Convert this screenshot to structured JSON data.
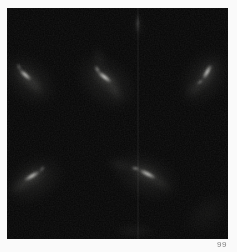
{
  "page": {
    "background": "#fafafa"
  },
  "figure": {
    "label": "99",
    "colors": {
      "background": "#060606",
      "core_rgb": "255,255,250",
      "glow_rgb": "190,190,182",
      "label_color": "#818181"
    },
    "noise_opacity": 0.09,
    "streaks": [
      {
        "name": "upper-left-arc",
        "parts": [
          {
            "type": "glow",
            "x": 22,
            "y": 72,
            "angle": 42,
            "len": 85,
            "w": 58,
            "op": 0.1
          },
          {
            "type": "glow",
            "x": 19,
            "y": 68,
            "angle": 42,
            "len": 44,
            "w": 17,
            "op": 0.2
          },
          {
            "type": "glow",
            "x": 29,
            "y": 78,
            "angle": 48,
            "len": 30,
            "w": 11,
            "op": 0.18
          },
          {
            "type": "core",
            "x": 18,
            "y": 67,
            "angle": 42,
            "len": 21,
            "w": 5.5,
            "op": 0.92
          },
          {
            "type": "core",
            "x": 12,
            "y": 59,
            "angle": 62,
            "len": 10,
            "w": 4,
            "op": 0.5
          }
        ]
      },
      {
        "name": "top-center-arc",
        "parts": [
          {
            "type": "glow",
            "x": 99,
            "y": 74,
            "angle": 40,
            "len": 92,
            "w": 64,
            "op": 0.11
          },
          {
            "type": "glow",
            "x": 98,
            "y": 70,
            "angle": 38,
            "len": 46,
            "w": 18,
            "op": 0.24
          },
          {
            "type": "glow",
            "x": 108,
            "y": 83,
            "angle": 55,
            "len": 30,
            "w": 11,
            "op": 0.2
          },
          {
            "type": "glow",
            "x": 92,
            "y": 50,
            "angle": 78,
            "len": 34,
            "w": 13,
            "op": 0.1
          },
          {
            "type": "core",
            "x": 97,
            "y": 69,
            "angle": 38,
            "len": 23,
            "w": 6,
            "op": 1.0
          },
          {
            "type": "core",
            "x": 90,
            "y": 61,
            "angle": 60,
            "len": 11,
            "w": 4.5,
            "op": 0.6
          }
        ]
      },
      {
        "name": "upper-right-arc",
        "parts": [
          {
            "type": "glow",
            "x": 197,
            "y": 70,
            "angle": -55,
            "len": 85,
            "w": 58,
            "op": 0.1
          },
          {
            "type": "glow",
            "x": 200,
            "y": 66,
            "angle": -60,
            "len": 44,
            "w": 17,
            "op": 0.22
          },
          {
            "type": "glow",
            "x": 188,
            "y": 80,
            "angle": -42,
            "len": 30,
            "w": 11,
            "op": 0.18
          },
          {
            "type": "core",
            "x": 200,
            "y": 64,
            "angle": -60,
            "len": 22,
            "w": 5.5,
            "op": 0.95
          },
          {
            "type": "core",
            "x": 193,
            "y": 74,
            "angle": -36,
            "len": 10,
            "w": 4,
            "op": 0.55
          }
        ]
      },
      {
        "name": "bottom-left-arc",
        "parts": [
          {
            "type": "glow",
            "x": 27,
            "y": 172,
            "angle": -30,
            "len": 85,
            "w": 58,
            "op": 0.1
          },
          {
            "type": "glow",
            "x": 25,
            "y": 169,
            "angle": -31,
            "len": 46,
            "w": 18,
            "op": 0.22
          },
          {
            "type": "glow",
            "x": 13,
            "y": 178,
            "angle": -24,
            "len": 30,
            "w": 11,
            "op": 0.16
          },
          {
            "type": "core",
            "x": 25,
            "y": 168,
            "angle": -31,
            "len": 24,
            "w": 6,
            "op": 0.9
          },
          {
            "type": "core",
            "x": 35,
            "y": 161,
            "angle": -48,
            "len": 10,
            "w": 4,
            "op": 0.5
          }
        ]
      },
      {
        "name": "bottom-center-arc",
        "parts": [
          {
            "type": "glow",
            "x": 138,
            "y": 168,
            "angle": 25,
            "len": 95,
            "w": 60,
            "op": 0.1
          },
          {
            "type": "glow",
            "x": 140,
            "y": 166,
            "angle": 27,
            "len": 48,
            "w": 18,
            "op": 0.22
          },
          {
            "type": "glow",
            "x": 113,
            "y": 157,
            "angle": 14,
            "len": 40,
            "w": 12,
            "op": 0.12
          },
          {
            "type": "glow",
            "x": 155,
            "y": 176,
            "angle": 33,
            "len": 28,
            "w": 10,
            "op": 0.16
          },
          {
            "type": "core",
            "x": 140,
            "y": 166,
            "angle": 27,
            "len": 25,
            "w": 6,
            "op": 0.9
          },
          {
            "type": "core",
            "x": 128,
            "y": 160,
            "angle": 10,
            "len": 11,
            "w": 4.5,
            "op": 0.55
          }
        ]
      },
      {
        "name": "top-edge-streak",
        "parts": [
          {
            "type": "glow",
            "x": 131,
            "y": 18,
            "angle": 90,
            "len": 36,
            "w": 10,
            "op": 0.1
          },
          {
            "type": "core",
            "x": 131,
            "y": 15,
            "angle": 90,
            "len": 26,
            "w": 2.5,
            "op": 0.3
          }
        ]
      },
      {
        "name": "bottom-edge-haze",
        "parts": [
          {
            "type": "glow",
            "x": 128,
            "y": 223,
            "angle": 0,
            "len": 60,
            "w": 20,
            "op": 0.08
          }
        ]
      },
      {
        "name": "bottom-right-haze",
        "parts": [
          {
            "type": "glow",
            "x": 200,
            "y": 205,
            "angle": -40,
            "len": 70,
            "w": 45,
            "op": 0.05
          }
        ]
      }
    ],
    "artifacts": [
      {
        "name": "vertical-seam",
        "x": 130,
        "y": 0,
        "w": 1.5,
        "h": 231,
        "opacity": 0.04
      }
    ]
  }
}
